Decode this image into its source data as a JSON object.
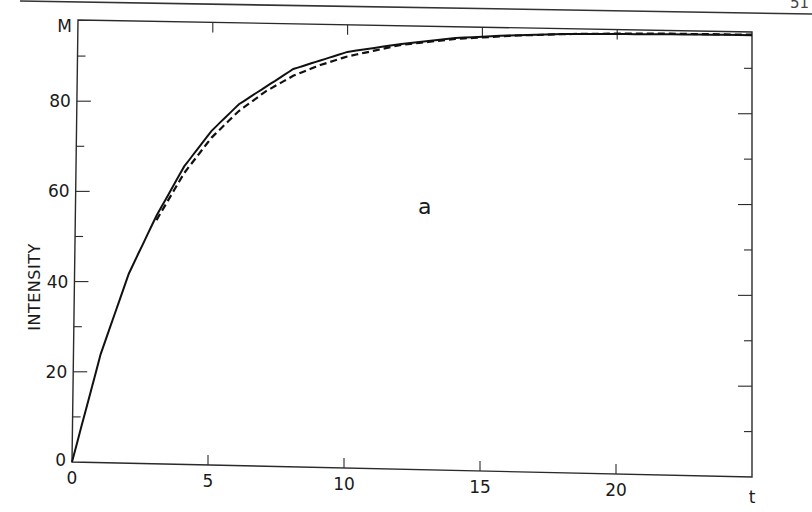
{
  "page": {
    "page_number_fragment": "51"
  },
  "chart_data": {
    "type": "line",
    "title": "",
    "panel_label": "a",
    "xlabel": "t",
    "ylabel": "INTENSITY",
    "xlim": [
      0,
      25
    ],
    "ylim": [
      0,
      98
    ],
    "x_ticks": [
      0,
      5,
      10,
      15,
      20
    ],
    "x_tick_labels": [
      "0",
      "5",
      "10",
      "15",
      "20",
      "t"
    ],
    "y_ticks": [
      0,
      20,
      40,
      60,
      80
    ],
    "y_tick_labels": [
      "0",
      "20",
      "40",
      "60",
      "80",
      "M"
    ],
    "y_top_label": "M",
    "grid": false,
    "legend": null,
    "series": [
      {
        "name": "solid curve",
        "style": "solid",
        "x": [
          0,
          1,
          2,
          3,
          4,
          5,
          6,
          7,
          8,
          9,
          10,
          12,
          14,
          16,
          18,
          20,
          22,
          25
        ],
        "values": [
          0,
          24,
          42,
          55,
          66,
          74,
          80,
          84,
          88,
          90,
          92,
          94,
          95.5,
          96.3,
          96.8,
          97,
          97.2,
          97.3
        ]
      },
      {
        "name": "dashed curve",
        "style": "dashed",
        "x": [
          3,
          4,
          5,
          6,
          7,
          8,
          9,
          10,
          12,
          14,
          16,
          18,
          20,
          22,
          25
        ],
        "values": [
          54,
          64.5,
          72.5,
          78.5,
          83,
          86.5,
          89,
          91,
          93.8,
          95.3,
          96.2,
          96.8,
          97.1,
          97.3,
          97.4
        ]
      }
    ],
    "annotations": [
      {
        "text": "a",
        "x": 13,
        "y": 62
      }
    ]
  }
}
